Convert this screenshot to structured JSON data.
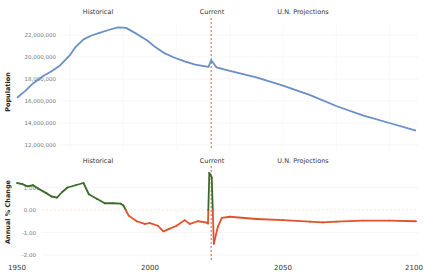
{
  "chart_data": [
    {
      "type": "line",
      "title": "",
      "xlabel": "",
      "ylabel": "Population",
      "xlim": [
        1950,
        2100
      ],
      "ylim": [
        12000000,
        23500000
      ],
      "grid": true,
      "yticks": [
        12000000,
        14000000,
        16000000,
        18000000,
        20000000,
        22000000
      ],
      "ytick_labels": [
        "12,000,000",
        "14,000,000",
        "16,000,000",
        "18,000,000",
        "20,000,000",
        "22,000,000"
      ],
      "annotations": [
        "Historical",
        "Current",
        "U.N. Projections"
      ],
      "current_year": 2023,
      "series": [
        {
          "name": "Population",
          "color": "#6a8fc7",
          "x": [
            1950,
            1953,
            1956,
            1960,
            1963,
            1966,
            1970,
            1972,
            1975,
            1978,
            1981,
            1985,
            1988,
            1991,
            1995,
            1999,
            2002,
            2005,
            2009,
            2013,
            2017,
            2022,
            2023,
            2025,
            2030,
            2040,
            2050,
            2060,
            2070,
            2080,
            2090,
            2100
          ],
          "values": [
            16300000,
            16900000,
            17600000,
            18300000,
            18700000,
            19200000,
            20200000,
            20900000,
            21600000,
            21950000,
            22200000,
            22500000,
            22700000,
            22650000,
            22100000,
            21500000,
            20900000,
            20400000,
            19950000,
            19600000,
            19300000,
            19100000,
            19700000,
            19050000,
            18750000,
            18150000,
            17400000,
            16550000,
            15550000,
            14700000,
            14000000,
            13300000
          ]
        }
      ]
    },
    {
      "type": "line",
      "title": "",
      "xlabel": "",
      "ylabel": "Annual % Change",
      "xlim": [
        1950,
        2100
      ],
      "ylim": [
        -2.0,
        1.8
      ],
      "grid": true,
      "yticks": [
        -2.0,
        -1.0,
        0.0,
        1.0
      ],
      "ytick_labels": [
        "-2.00",
        "-1.00",
        "0.00",
        "1.00"
      ],
      "xticks": [
        1950,
        2000,
        2050,
        2100
      ],
      "xtick_labels": [
        "1950",
        "2000",
        "2050",
        "2100"
      ],
      "annotations": [
        "Historical",
        "Current",
        "U.N. Projections"
      ],
      "current_year": 2023,
      "positive_color": "#3a6b2a",
      "negative_color": "#e0522a",
      "series": [
        {
          "name": "Annual % Change",
          "x": [
            1950,
            1952,
            1954,
            1956,
            1958,
            1961,
            1963,
            1965,
            1967,
            1969,
            1972,
            1975,
            1977,
            1980,
            1983,
            1986,
            1989,
            1990,
            1992,
            1995,
            1998,
            2000,
            2003,
            2005,
            2007,
            2010,
            2013,
            2015,
            2018,
            2021,
            2021.8,
            2022.3,
            2023.2,
            2024,
            2025.5,
            2027,
            2030,
            2040,
            2050,
            2060,
            2065,
            2070,
            2080,
            2090,
            2100
          ],
          "values": [
            1.2,
            1.15,
            1.05,
            1.1,
            0.95,
            0.75,
            0.6,
            0.55,
            0.8,
            1.0,
            1.1,
            1.2,
            0.7,
            0.5,
            0.3,
            0.3,
            0.28,
            0.2,
            -0.25,
            -0.5,
            -0.62,
            -0.58,
            -0.7,
            -0.95,
            -0.85,
            -0.7,
            -0.45,
            -0.62,
            -0.5,
            -0.55,
            -0.6,
            1.65,
            1.45,
            -1.5,
            -0.75,
            -0.35,
            -0.3,
            -0.4,
            -0.45,
            -0.52,
            -0.55,
            -0.52,
            -0.47,
            -0.47,
            -0.5
          ]
        }
      ]
    }
  ],
  "labels": {
    "top": {
      "historical": "Historical",
      "current": "Current",
      "projections": "U.N. Projections",
      "ylabel": "Population"
    },
    "bottom": {
      "historical": "Historical",
      "current": "Current",
      "projections": "U.N. Projections",
      "ylabel": "Annual % Change"
    },
    "xticks": [
      "1950",
      "2000",
      "2050",
      "2100"
    ]
  }
}
